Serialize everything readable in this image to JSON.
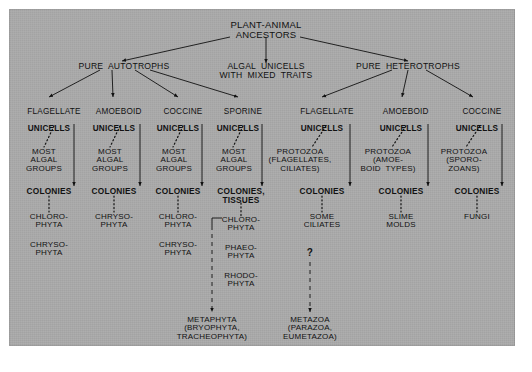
{
  "diagram": {
    "title_node": "PLANT-ANIMAL\nANCESTORS",
    "level1": [
      {
        "id": "pure-autotrophs",
        "label": "PURE  AUTOTROPHS"
      },
      {
        "id": "algal-unicells-mixed",
        "label": "ALGAL  UNICELLS\nWITH  MIXED  TRAITS"
      },
      {
        "id": "pure-heterotrophs",
        "label": "PURE  HETEROTROPHS"
      }
    ],
    "columns": [
      {
        "id": "flagellate-auto",
        "unicell_type": "FLAGELLATE",
        "unicell_label": "UNICELLS",
        "middle": "MOST\nALGAL\nGROUPS",
        "colonies": "COLONIES",
        "leaves": [
          "CHLORO-\nPHYTA",
          "CHRYSO-\nPHYTA"
        ]
      },
      {
        "id": "amoeboid-auto",
        "unicell_type": "AMOEBOID",
        "unicell_label": "UNICELLS",
        "middle": "MOST\nALGAL\nGROUPS",
        "colonies": "COLONIES",
        "leaves": [
          "CHRYSO-\nPHYTA"
        ]
      },
      {
        "id": "coccine-auto",
        "unicell_type": "COCCINE",
        "unicell_label": "UNICELLS",
        "middle": "MOST\nALGAL\nGROUPS",
        "colonies": "COLONIES",
        "leaves": [
          "CHLORO-\nPHYTA",
          "CHRYSO-\nPHYTA"
        ]
      },
      {
        "id": "sporine-auto",
        "unicell_type": "SPORINE",
        "unicell_label": "UNICELLS",
        "middle": "MOST\nALGAL\nGROUPS",
        "colonies": "COLONIES,\nTISSUES",
        "leaves": [
          "CHLORO-\nPHYTA",
          "PHAEO-\nPHYTA",
          "RHODO-\nPHYTA"
        ]
      },
      {
        "id": "flagellate-hetero",
        "unicell_type": "FLAGELLATE",
        "unicell_label": "UNICELLS",
        "middle": "PROTOZOA\n(FLAGELLATES,\nCILIATES)",
        "colonies": "COLONIES",
        "leaves": [
          "SOME\nCILIATES"
        ]
      },
      {
        "id": "amoeboid-hetero",
        "unicell_type": "AMOEBOID",
        "unicell_label": "UNICELLS",
        "middle": "PROTOZOA\n(AMOE-\nBOID  TYPES)",
        "colonies": "COLONIES",
        "leaves": [
          "SLIME\nMOLDS"
        ]
      },
      {
        "id": "coccine-hetero",
        "unicell_type": "COCCINE",
        "unicell_label": "UNICELLS",
        "middle": "PROTOZOA\n(SPORO-\nZOANS)",
        "colonies": "COLONIES",
        "leaves": [
          "FUNGI"
        ]
      }
    ],
    "bottom": [
      {
        "id": "metaphyta",
        "label": "METAPHYTA\n(BRYOPHYTA,\nTRACHEOPHYTA)"
      },
      {
        "id": "metazoa",
        "label": "METAZOA\n(PARAZOA,\nEUMETAZOA)"
      }
    ],
    "uncertainty_marker": "?",
    "colors": {
      "panel_background": "#a9a9a9",
      "page_background": "#ffffff",
      "ink": "#111111"
    }
  }
}
